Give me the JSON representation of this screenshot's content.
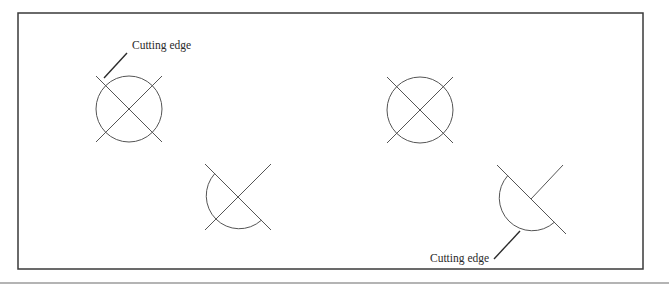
{
  "figure": {
    "frame": {
      "x": 18,
      "y": 13,
      "width": 625,
      "height": 256,
      "stroke": "#3a3a3a"
    },
    "bottom_rule": {
      "x1": 0,
      "x2": 669,
      "y": 283,
      "stroke": "#6a6a6a"
    },
    "stroke_color": "#555555",
    "leader_color": "#2a2a2a",
    "labels": [
      {
        "id": "label-top-left",
        "text": "Cutting edge",
        "x": 132,
        "y": 41
      },
      {
        "id": "label-bottom-right",
        "text": "Cutting edge",
        "x": 430,
        "y": 254
      }
    ],
    "shapes": [
      {
        "name": "full-circle-top-left",
        "type": "full-circle-with-cross",
        "cx": 129,
        "cy": 109,
        "r": 33
      },
      {
        "name": "full-circle-top-right",
        "type": "full-circle-with-cross",
        "cx": 420,
        "cy": 110,
        "r": 33
      },
      {
        "name": "half-circle-bottom-left",
        "type": "half-circle-with-cross",
        "cx": 238,
        "cy": 197,
        "r": 33
      },
      {
        "name": "half-circle-bottom-right",
        "type": "half-circle-with-partial-cross",
        "cx": 531,
        "cy": 199,
        "r": 33
      }
    ]
  }
}
